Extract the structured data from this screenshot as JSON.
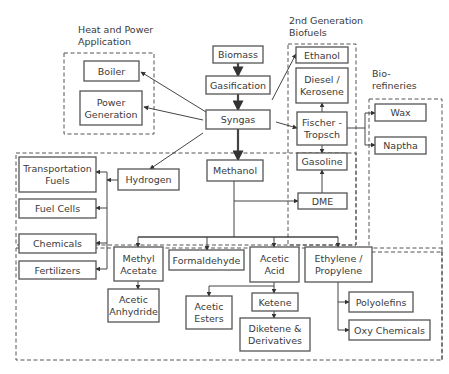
{
  "groups": [
    {
      "id": "heat-power",
      "label": [
        "Heat and Power",
        "Application"
      ],
      "x": 64,
      "y": 53,
      "w": 90,
      "h": 81,
      "lx": 78,
      "ly": 33
    },
    {
      "id": "second-gen-biofuels",
      "label": [
        "2nd Generation",
        "Biofuels"
      ],
      "x": 288,
      "y": 44,
      "w": 68,
      "h": 246,
      "lx": 289,
      "ly": 24,
      "points": "288,44 356,44 356,248 288,248"
    },
    {
      "id": "biorefineries",
      "label": [
        "Bio-",
        "refineries"
      ],
      "x": 369,
      "y": 99,
      "w": 142,
      "h": 190,
      "lx": 372,
      "ly": 77
    },
    {
      "id": "hydrogen-methanol-region",
      "label": [],
      "x": 16,
      "y": 153,
      "w": 340,
      "h": 84
    },
    {
      "id": "chemicals-region",
      "label": [],
      "x": 16,
      "y": 241,
      "w": 430,
      "h": 118
    }
  ],
  "nodes": [
    {
      "id": "biomass",
      "label": [
        "Biomass"
      ],
      "x": 213,
      "y": 46,
      "w": 50,
      "h": 17
    },
    {
      "id": "gasification",
      "label": [
        "Gasification"
      ],
      "x": 206,
      "y": 76,
      "w": 64,
      "h": 18
    },
    {
      "id": "syngas",
      "label": [
        "Syngas"
      ],
      "x": 206,
      "y": 110,
      "w": 64,
      "h": 19
    },
    {
      "id": "boiler",
      "label": [
        "Boiler"
      ],
      "x": 84,
      "y": 61,
      "w": 55,
      "h": 20
    },
    {
      "id": "power-generation",
      "label": [
        "Power",
        "Generation"
      ],
      "x": 80,
      "y": 91,
      "w": 62,
      "h": 34
    },
    {
      "id": "ethanol",
      "label": [
        "Ethanol"
      ],
      "x": 296,
      "y": 47,
      "w": 52,
      "h": 16
    },
    {
      "id": "diesel-kerosene",
      "label": [
        "Diesel /",
        "Kerosene"
      ],
      "x": 296,
      "y": 68,
      "w": 52,
      "h": 35
    },
    {
      "id": "fischer-tropsch",
      "label": [
        "Fischer -",
        "Tropsch"
      ],
      "x": 297,
      "y": 112,
      "w": 50,
      "h": 33
    },
    {
      "id": "gasoline",
      "label": [
        "Gasoline"
      ],
      "x": 297,
      "y": 153,
      "w": 50,
      "h": 17
    },
    {
      "id": "dme",
      "label": [
        "DME"
      ],
      "x": 298,
      "y": 193,
      "w": 49,
      "h": 16
    },
    {
      "id": "wax",
      "label": [
        "Wax"
      ],
      "x": 375,
      "y": 104,
      "w": 51,
      "h": 17
    },
    {
      "id": "naptha",
      "label": [
        "Naptha"
      ],
      "x": 375,
      "y": 137,
      "w": 51,
      "h": 17
    },
    {
      "id": "hydrogen",
      "label": [
        "Hydrogen"
      ],
      "x": 118,
      "y": 169,
      "w": 61,
      "h": 21
    },
    {
      "id": "methanol",
      "label": [
        "Methanol"
      ],
      "x": 207,
      "y": 160,
      "w": 56,
      "h": 21
    },
    {
      "id": "transportation-fuels",
      "label": [
        "Transportation",
        "Fuels"
      ],
      "x": 19,
      "y": 157,
      "w": 77,
      "h": 35
    },
    {
      "id": "fuel-cells",
      "label": [
        "Fuel Cells"
      ],
      "x": 19,
      "y": 199,
      "w": 77,
      "h": 19
    },
    {
      "id": "chemicals",
      "label": [
        "Chemicals"
      ],
      "x": 19,
      "y": 234,
      "w": 77,
      "h": 19
    },
    {
      "id": "fertilizers",
      "label": [
        "Fertilizers"
      ],
      "x": 19,
      "y": 261,
      "w": 77,
      "h": 18
    },
    {
      "id": "methyl-acetate",
      "label": [
        "Methyl",
        "Acetate"
      ],
      "x": 114,
      "y": 247,
      "w": 49,
      "h": 34
    },
    {
      "id": "formaldehyde",
      "label": [
        "Formaldehyde"
      ],
      "x": 169,
      "y": 250,
      "w": 75,
      "h": 20
    },
    {
      "id": "acetic-acid",
      "label": [
        "Acetic",
        "Acid"
      ],
      "x": 250,
      "y": 247,
      "w": 49,
      "h": 35
    },
    {
      "id": "ethylene-propylene",
      "label": [
        "Ethylene /",
        "Propylene"
      ],
      "x": 305,
      "y": 247,
      "w": 67,
      "h": 35
    },
    {
      "id": "acetic-anhydride",
      "label": [
        "Acetic",
        "Anhydride"
      ],
      "x": 108,
      "y": 289,
      "w": 51,
      "h": 33
    },
    {
      "id": "acetic-esters",
      "label": [
        "Acetic",
        "Esters"
      ],
      "x": 186,
      "y": 296,
      "w": 46,
      "h": 33
    },
    {
      "id": "ketene",
      "label": [
        "Ketene"
      ],
      "x": 252,
      "y": 293,
      "w": 46,
      "h": 18
    },
    {
      "id": "diketene-derivatives",
      "label": [
        "Diketene &",
        "Derivatives"
      ],
      "x": 240,
      "y": 318,
      "w": 70,
      "h": 33
    },
    {
      "id": "polyolefins",
      "label": [
        "Polyolefins"
      ],
      "x": 349,
      "y": 292,
      "w": 64,
      "h": 20
    },
    {
      "id": "oxy-chemicals",
      "label": [
        "Oxy Chemicals"
      ],
      "x": 349,
      "y": 320,
      "w": 81,
      "h": 20
    }
  ],
  "edges": [
    {
      "from": "biomass",
      "to": "gasification",
      "points": "238,63 238,76",
      "thick": true
    },
    {
      "from": "gasification",
      "to": "syngas",
      "points": "238,94 238,110",
      "thick": true
    },
    {
      "from": "syngas",
      "to": "methanol",
      "points": "238,129 238,160",
      "thick": true
    },
    {
      "from": "syngas",
      "to": "boiler",
      "points": "206,112 141,72"
    },
    {
      "from": "syngas",
      "to": "power-generation",
      "points": "203,120 144,107"
    },
    {
      "from": "syngas",
      "to": "ethanol",
      "points": "272,100 296,54"
    },
    {
      "from": "syngas",
      "to": "fischer-tropsch",
      "points": "276,122 297,128"
    },
    {
      "from": "syngas",
      "to": "hydrogen",
      "points": "203,133 150,169"
    },
    {
      "from": "fischer-tropsch",
      "to": "diesel-kerosene",
      "points": "322,112 322,103"
    },
    {
      "from": "fischer-tropsch",
      "to": "gasoline",
      "points": "322,145 322,153"
    },
    {
      "from": "fischer-tropsch",
      "to": "wax",
      "points": "347,128 365,128 365,113 375,113"
    },
    {
      "from": "fischer-tropsch",
      "to": "naptha",
      "points": "365,128 365,145 375,145"
    },
    {
      "from": "dme",
      "to": "gasoline",
      "points": "322,193 322,170"
    },
    {
      "from": "methanol",
      "to": "dme",
      "points": "234,201 298,201"
    },
    {
      "from": "hydrogen",
      "to": "hydrogen-bus",
      "points": "118,180 107,180"
    },
    {
      "from": "hydrogen-bus",
      "to": "transportation-fuels",
      "points": "107,172 96,172"
    },
    {
      "from": "hydrogen-bus",
      "to": "fuel-cells",
      "points": "107,208 96,208"
    },
    {
      "from": "hydrogen-bus",
      "to": "chemicals",
      "points": "107,243 96,243"
    },
    {
      "from": "hydrogen-bus",
      "to": "fertilizers",
      "points": "107,269 96,269"
    },
    {
      "from": "methanol",
      "to": "methyl-acetate",
      "points": "234,181 234,237 138,237 138,247"
    },
    {
      "from": "methanol",
      "to": "formaldehyde",
      "points": "207,237 207,250"
    },
    {
      "from": "methanol",
      "to": "acetic-acid",
      "points": "234,237 274,237 274,247"
    },
    {
      "from": "methanol",
      "to": "ethylene-propylene",
      "points": "274,237 338,237 338,247"
    },
    {
      "from": "methyl-acetate",
      "to": "acetic-anhydride",
      "points": "138,281 138,289"
    },
    {
      "from": "acetic-acid",
      "to": "acetic-esters",
      "points": "274,282 274,286 209,286 209,296"
    },
    {
      "from": "acetic-acid",
      "to": "ketene",
      "points": "274,286 274,293"
    },
    {
      "from": "ketene",
      "to": "diketene-derivatives",
      "points": "274,311 274,318"
    },
    {
      "from": "ethylene-propylene",
      "to": "polyolefins",
      "points": "338,282 338,302 349,302"
    },
    {
      "from": "ethylene-propylene",
      "to": "oxy-chemicals",
      "points": "338,302 338,330 349,330"
    }
  ]
}
